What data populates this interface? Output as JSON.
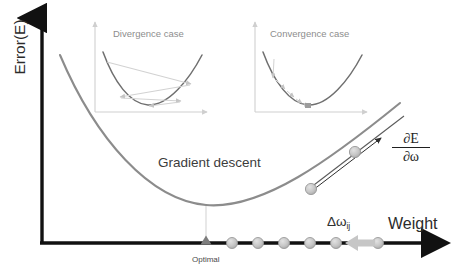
{
  "figure": {
    "type": "diagram",
    "background_color": "#ffffff"
  },
  "axes": {
    "y_label": "Error(E)",
    "x_label": "Weight",
    "axis_color": "#111111",
    "origin_x": 42,
    "origin_y": 243,
    "x_end": 452,
    "y_top": 12
  },
  "main_curve": {
    "name": "error-parabola",
    "color": "#8c8c8c",
    "label": "Gradient descent",
    "minimum_label": "Optimal",
    "vertex_x": 206,
    "vertex_y": 205
  },
  "gradient": {
    "label_numerator": "∂E",
    "label_denominator": "∂ω",
    "tangent_color": "#3a3a3a",
    "ball_color": "#b8b8b8"
  },
  "step": {
    "label_delta": "Δω",
    "label_subscript": "ij",
    "arrow_color": "#bdbdbd",
    "direction": "left"
  },
  "axis_balls": {
    "color": "#c2c2c2",
    "stroke": "#9a9a9a",
    "count": 6,
    "positions_x": [
      232,
      258,
      284,
      310,
      336,
      378
    ],
    "y": 243,
    "radius": 5.5
  },
  "optimal_marker": {
    "name": "optimal-triangle",
    "color": "#7d7d7d",
    "x": 206,
    "y": 243
  },
  "insets": [
    {
      "id": "divergence",
      "title": "Divergence case",
      "x": 92,
      "y": 20,
      "width": 118,
      "height": 92,
      "axis_color": "#cfcfcf",
      "curve_color": "#6f6f6f",
      "path_color": "#d2d2d2",
      "behavior": "oscillating-overshoot",
      "steps": [
        {
          "x": 0.12,
          "y": 0.2
        },
        {
          "x": 0.8,
          "y": 0.42
        },
        {
          "x": 0.23,
          "y": 0.68
        },
        {
          "x": 0.72,
          "y": 0.74
        },
        {
          "x": 0.45,
          "y": 0.93
        }
      ]
    },
    {
      "id": "convergence",
      "title": "Convergence case",
      "x": 252,
      "y": 20,
      "width": 118,
      "height": 92,
      "axis_color": "#cfcfcf",
      "curve_color": "#6f6f6f",
      "path_color": "#d2d2d2",
      "behavior": "monotonic-descent",
      "steps": [
        {
          "x": 0.16,
          "y": 0.16
        },
        {
          "x": 0.2,
          "y": 0.48
        },
        {
          "x": 0.3,
          "y": 0.58
        },
        {
          "x": 0.36,
          "y": 0.74
        },
        {
          "x": 0.44,
          "y": 0.85
        },
        {
          "x": 0.5,
          "y": 0.95
        }
      ]
    }
  ]
}
